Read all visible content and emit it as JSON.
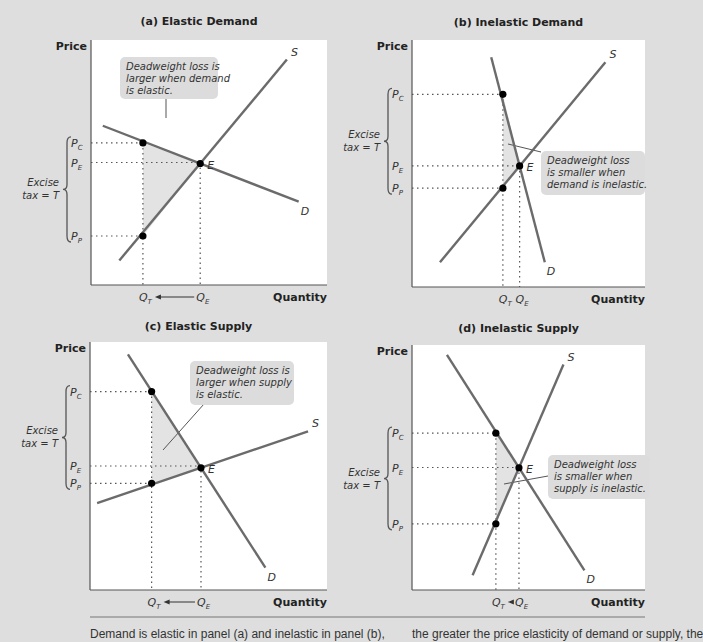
{
  "figure": {
    "caption_left": "Demand is elastic in panel (a) and inelastic in panel (b),",
    "caption_right": "the greater the price elasticity of demand or supply, the"
  },
  "chart_data": [
    {
      "type": "line",
      "id": "a",
      "title": "(a) Elastic Demand",
      "ylabel": "Price",
      "xlabel": "Quantity",
      "series": [
        {
          "name": "D",
          "points": [
            [
              0.05,
              0.65
            ],
            [
              0.88,
              0.34
            ]
          ]
        },
        {
          "name": "S",
          "points": [
            [
              0.12,
              0.1
            ],
            [
              0.83,
              0.92
            ]
          ]
        }
      ],
      "prices": {
        "P_C": 0.58,
        "P_E": 0.5,
        "P_P": 0.2
      },
      "quantities": {
        "Q_T": 0.22,
        "Q_E": 0.47
      },
      "equilibrium_label": "E",
      "excise_label": [
        "Excise",
        "tax = T"
      ],
      "callout": [
        "Deadweight loss is",
        "larger when demand",
        "is elastic."
      ],
      "arrow": "Q_E to Q_T",
      "labels": {
        "price_c": "P",
        "sub_c": "C",
        "price_e": "P",
        "sub_e": "E",
        "price_p": "P",
        "sub_p": "P",
        "q_t": "Q",
        "sub_t": "T",
        "q_e": "Q",
        "sub_qe": "E",
        "supply": "S",
        "demand": "D"
      }
    },
    {
      "type": "line",
      "id": "b",
      "title": "(b) Inelastic Demand",
      "ylabel": "Price",
      "xlabel": "Quantity",
      "series": [
        {
          "name": "D",
          "points": [
            [
              0.34,
              0.93
            ],
            [
              0.57,
              0.1
            ]
          ]
        },
        {
          "name": "S",
          "points": [
            [
              0.12,
              0.1
            ],
            [
              0.83,
              0.91
            ]
          ]
        }
      ],
      "prices": {
        "P_C": 0.78,
        "P_E": 0.49,
        "P_P": 0.4
      },
      "quantities": {
        "Q_T": 0.39,
        "Q_E": 0.46
      },
      "equilibrium_label": "E",
      "excise_label": [
        "Excise",
        "tax = T"
      ],
      "callout": [
        "Deadweight loss",
        "is smaller when",
        "demand is inelastic."
      ],
      "arrow": "Q_E to Q_T",
      "labels": {
        "price_c": "P",
        "sub_c": "C",
        "price_e": "P",
        "sub_e": "E",
        "price_p": "P",
        "sub_p": "P",
        "q_t": "Q",
        "sub_t": "T",
        "q_e": "Q",
        "sub_qe": "E",
        "supply": "S",
        "demand": "D"
      }
    },
    {
      "type": "line",
      "id": "c",
      "title": "(c) Elastic Supply",
      "ylabel": "Price",
      "xlabel": "Quantity",
      "series": [
        {
          "name": "D",
          "points": [
            [
              0.16,
              0.95
            ],
            [
              0.74,
              0.09
            ]
          ]
        },
        {
          "name": "S",
          "points": [
            [
              0.03,
              0.35
            ],
            [
              0.92,
              0.64
            ]
          ]
        }
      ],
      "prices": {
        "P_C": 0.8,
        "P_E": 0.5,
        "P_P": 0.43
      },
      "quantities": {
        "Q_T": 0.26,
        "Q_E": 0.46
      },
      "equilibrium_label": "E",
      "excise_label": [
        "Excise",
        "tax = T"
      ],
      "callout": [
        "Deadweight loss is",
        "larger when supply",
        "is elastic."
      ],
      "arrow": "Q_E to Q_T",
      "labels": {
        "price_c": "P",
        "sub_c": "C",
        "price_e": "P",
        "sub_e": "E",
        "price_p": "P",
        "sub_p": "P",
        "q_t": "Q",
        "sub_t": "T",
        "q_e": "Q",
        "sub_qe": "E",
        "supply": "S",
        "demand": "D"
      }
    },
    {
      "type": "line",
      "id": "d",
      "title": "(d) Inelastic Supply",
      "ylabel": "Price",
      "xlabel": "Quantity",
      "series": [
        {
          "name": "D",
          "points": [
            [
              0.15,
              0.96
            ],
            [
              0.74,
              0.08
            ]
          ]
        },
        {
          "name": "S",
          "points": [
            [
              0.26,
              0.06
            ],
            [
              0.65,
              0.92
            ]
          ]
        }
      ],
      "prices": {
        "P_C": 0.64,
        "P_E": 0.5,
        "P_P": 0.27
      },
      "quantities": {
        "Q_T": 0.36,
        "Q_E": 0.46
      },
      "equilibrium_label": "E",
      "excise_label": [
        "Excise",
        "tax = T"
      ],
      "callout": [
        "Deadweight loss",
        "is smaller when",
        "supply is inelastic."
      ],
      "arrow": "Q_E to Q_T",
      "labels": {
        "price_c": "P",
        "sub_c": "C",
        "price_e": "P",
        "sub_e": "E",
        "price_p": "P",
        "sub_p": "P",
        "q_t": "Q",
        "sub_t": "T",
        "q_e": "Q",
        "sub_qe": "E",
        "supply": "S",
        "demand": "D"
      }
    }
  ],
  "colors": {
    "background": "#dedede",
    "plot_bg": "#ffffff",
    "curve": "#6b6b6b",
    "deadweight_fill": "#e3e3e3",
    "callout_fill": "#dcdcdc",
    "point": "#000000",
    "axis": "#555555"
  }
}
